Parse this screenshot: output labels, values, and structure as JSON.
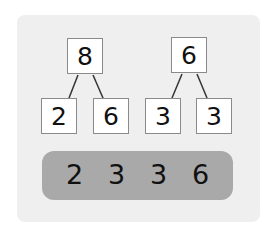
{
  "trees": [
    {
      "root": "8",
      "children": [
        "2",
        "6"
      ]
    },
    {
      "root": "6",
      "children": [
        "3",
        "3"
      ]
    }
  ],
  "result_row": [
    "2",
    "3",
    "3",
    "6"
  ],
  "colors": {
    "panel": "#efefef",
    "bar": "#a9a9a9",
    "box_border": "#8a8a8a"
  }
}
